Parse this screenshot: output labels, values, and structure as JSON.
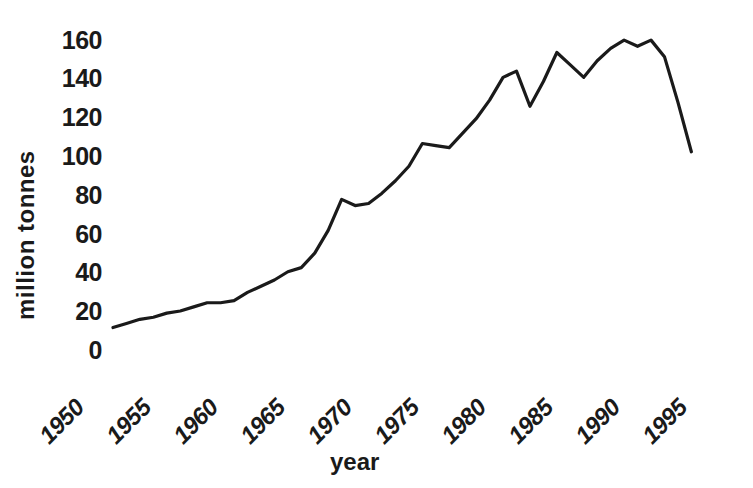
{
  "chart_data": {
    "type": "line",
    "title": "",
    "subtitle": "",
    "xlabel": "year",
    "ylabel": "million tonnes",
    "xlim": [
      1950,
      1995
    ],
    "ylim": [
      0,
      168
    ],
    "grid": false,
    "legend": null,
    "line_color": "#1a1a1a",
    "xticks": [
      "1950",
      "1955",
      "1960",
      "1965",
      "1970",
      "1975",
      "1980",
      "1985",
      "1990",
      "1995"
    ],
    "yticks": [
      "0",
      "20",
      "40",
      "60",
      "80",
      "100",
      "120",
      "140",
      "160"
    ],
    "series": [
      {
        "name": "million tonnes",
        "x": [
          1950,
          1951,
          1952,
          1953,
          1954,
          1955,
          1956,
          1957,
          1958,
          1959,
          1960,
          1961,
          1962,
          1963,
          1964,
          1965,
          1966,
          1967,
          1968,
          1969,
          1970,
          1971,
          1972,
          1973,
          1974,
          1975,
          1976,
          1977,
          1978,
          1979,
          1980,
          1981,
          1982,
          1983,
          1984,
          1985,
          1986,
          1987,
          1988,
          1989,
          1990,
          1991,
          1992,
          1993
        ],
        "values": [
          21,
          23,
          25,
          26,
          28,
          29,
          31,
          33,
          33,
          34,
          38,
          41,
          44,
          48,
          50,
          57,
          68,
          83,
          80,
          81,
          86,
          92,
          99,
          110,
          109,
          108,
          115,
          122,
          131,
          142,
          145,
          128,
          140,
          154,
          148,
          142,
          150,
          156,
          160,
          157,
          160,
          152,
          130,
          106
        ]
      }
    ],
    "annotations": []
  }
}
